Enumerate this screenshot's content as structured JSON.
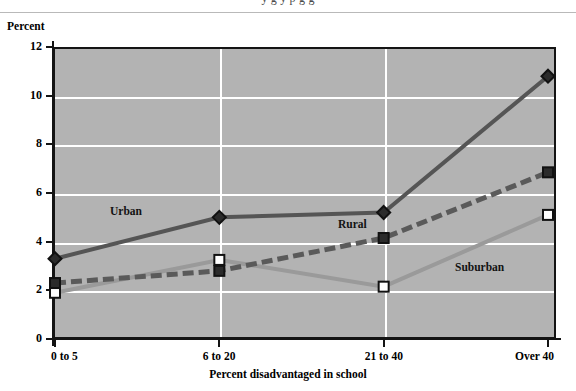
{
  "page": {
    "title_fragment": "y g         y  p           g  g       ",
    "y_axis_title": "Percent"
  },
  "chart_data": {
    "type": "line",
    "title": "",
    "xlabel": "Percent disadvantaged in school",
    "ylabel": "Percent",
    "categories": [
      "0 to 5",
      "6 to 20",
      "21 to 40",
      "Over 40"
    ],
    "yticks": [
      "0",
      "2",
      "4",
      "6",
      "8",
      "10",
      "12"
    ],
    "ylim": [
      0,
      12
    ],
    "grid": "horizontal-and-vertical",
    "legend": "inline-labels",
    "plot_background": "#b3b3b3",
    "series": [
      {
        "name": "Urban",
        "values": [
          3.3,
          5.0,
          5.2,
          10.8
        ],
        "color": "#555555",
        "style": "solid",
        "marker": "diamond",
        "marker_fill": "#2b2b2b",
        "label_x": 110,
        "label_y": 205
      },
      {
        "name": "Rural",
        "values": [
          2.3,
          2.8,
          4.15,
          6.85
        ],
        "color": "#5a5a5a",
        "style": "dashed",
        "marker": "square",
        "marker_fill": "#2b2b2b",
        "label_x": 338,
        "label_y": 218
      },
      {
        "name": "Suburban",
        "values": [
          1.9,
          3.25,
          2.15,
          5.1
        ],
        "color": "#9a9a9a",
        "style": "solid",
        "marker": "square",
        "marker_fill": "#ffffff",
        "label_x": 455,
        "label_y": 261
      }
    ]
  }
}
